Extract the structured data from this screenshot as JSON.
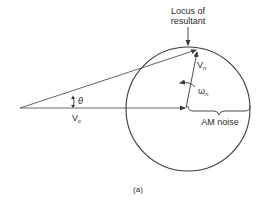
{
  "diagram": {
    "locus_label_line1": "Locus of",
    "locus_label_line2": "resultant",
    "vn_label": "V",
    "vn_sub": "n",
    "omega_label": "ω",
    "omega_sub": "n",
    "theta_label": "θ",
    "vc_label": "V",
    "vc_sub": "c",
    "am_noise_label": "AM noise",
    "caption": "(a)"
  },
  "colors": {
    "line": "#3a3a3a",
    "background": "#ffffff"
  }
}
